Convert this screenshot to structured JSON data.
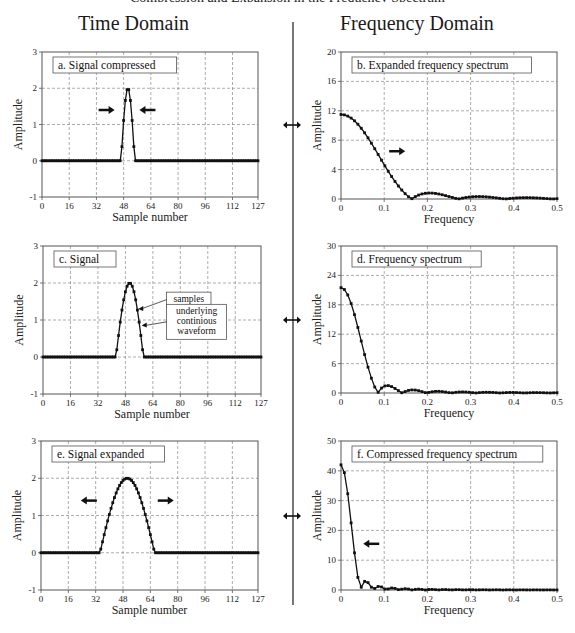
{
  "headings": {
    "time_domain": "Time Domain",
    "frequency_domain": "Frequency Domain",
    "clipped_top_title": "Compression and Expansion in the Frequency Spectrum"
  },
  "colors": {
    "line": "#111111",
    "grid": "#8a8a8a",
    "frame": "#555555",
    "divider": "#777777"
  },
  "chart_data": [
    {
      "id": "a",
      "type": "line",
      "title": "a.  Signal compressed",
      "xlabel": "Sample number",
      "ylabel": "Amplitude",
      "xlim": [
        0,
        127
      ],
      "ylim": [
        -1,
        3
      ],
      "xticks": [
        0,
        16,
        32,
        48,
        64,
        80,
        96,
        112,
        127
      ],
      "yticks": [
        -1,
        0,
        1,
        2,
        3
      ],
      "grid": true,
      "markers": true,
      "signal": {
        "kind": "hump",
        "center": 50.5,
        "half_width": 4,
        "peak": 2
      },
      "annotations": [
        {
          "type": "arrow-right",
          "x": 38,
          "y": 1.4
        },
        {
          "type": "arrow-left",
          "x": 62,
          "y": 1.4
        }
      ]
    },
    {
      "id": "b",
      "type": "line",
      "title": "b.  Expanded frequency spectrum",
      "xlabel": "Frequency",
      "ylabel": "Amplitude",
      "xlim": [
        0,
        0.5
      ],
      "ylim": [
        0,
        20
      ],
      "xticks": [
        0,
        0.1,
        0.2,
        0.3,
        0.4,
        0.5
      ],
      "yticks": [
        0,
        4,
        8,
        12,
        16,
        20
      ],
      "grid": true,
      "markers": true,
      "spectrum": {
        "peak": 11.5,
        "first_null": 0.163,
        "points": 64
      },
      "annotations": [
        {
          "type": "arrow-right",
          "x": 0.13,
          "y": 6.5
        }
      ]
    },
    {
      "id": "c",
      "type": "line",
      "title": "c.  Signal",
      "xlabel": "Sample number",
      "ylabel": "Amplitude",
      "xlim": [
        0,
        127
      ],
      "ylim": [
        -1,
        3
      ],
      "xticks": [
        0,
        16,
        32,
        48,
        64,
        80,
        96,
        112,
        127
      ],
      "yticks": [
        -1,
        0,
        1,
        2,
        3
      ],
      "grid": true,
      "markers": true,
      "signal": {
        "kind": "hump",
        "center": 50.5,
        "half_width": 8,
        "peak": 2
      },
      "callouts": [
        {
          "text": [
            "samples"
          ],
          "box_x": 72,
          "box_y": 1.55
        },
        {
          "text": [
            "underlying",
            "continious",
            "waveform"
          ],
          "box_x": 72,
          "box_y": 0.95
        }
      ]
    },
    {
      "id": "d",
      "type": "line",
      "title": "d.  Frequency spectrum",
      "xlabel": "Frequency",
      "ylabel": "Amplitude",
      "xlim": [
        0,
        0.5
      ],
      "ylim": [
        0,
        30
      ],
      "xticks": [
        0,
        0.1,
        0.2,
        0.3,
        0.4,
        0.5
      ],
      "yticks": [
        0,
        6,
        12,
        18,
        24,
        30
      ],
      "grid": true,
      "markers": true,
      "spectrum": {
        "peak": 21.5,
        "first_null": 0.085,
        "points": 64
      }
    },
    {
      "id": "e",
      "type": "line",
      "title": "e.  Signal expanded",
      "xlabel": "Sample number",
      "ylabel": "Amplitude",
      "xlim": [
        0,
        127
      ],
      "ylim": [
        -1,
        3
      ],
      "xticks": [
        0,
        16,
        32,
        48,
        64,
        80,
        96,
        112,
        127
      ],
      "yticks": [
        -1,
        0,
        1,
        2,
        3
      ],
      "grid": true,
      "markers": true,
      "signal": {
        "kind": "hump",
        "center": 50.5,
        "half_width": 16,
        "peak": 2
      },
      "annotations": [
        {
          "type": "arrow-left",
          "x": 28,
          "y": 1.4
        },
        {
          "type": "arrow-right",
          "x": 73,
          "y": 1.4
        }
      ]
    },
    {
      "id": "f",
      "type": "line",
      "title": "f.  Compressed frequency spectrum",
      "xlabel": "Frequency",
      "ylabel": "Amplitude",
      "xlim": [
        0,
        0.5
      ],
      "ylim": [
        0,
        50
      ],
      "xticks": [
        0,
        0.1,
        0.2,
        0.3,
        0.4,
        0.5
      ],
      "yticks": [
        0,
        10,
        20,
        30,
        40,
        50
      ],
      "grid": true,
      "markers": true,
      "spectrum": {
        "peak": 42,
        "first_null": 0.045,
        "points": 64
      },
      "annotations": [
        {
          "type": "arrow-left",
          "x": 0.07,
          "y": 15.5
        }
      ]
    }
  ],
  "layout": {
    "a": {
      "x0": 42,
      "y0": 52,
      "x1": 258,
      "y1": 197
    },
    "b": {
      "x0": 341,
      "y0": 52,
      "x1": 557,
      "y1": 199
    },
    "c": {
      "x0": 43,
      "y0": 246,
      "x1": 261,
      "y1": 394
    },
    "d": {
      "x0": 341,
      "y0": 246,
      "x1": 557,
      "y1": 393
    },
    "e": {
      "x0": 41,
      "y0": 441,
      "x1": 258,
      "y1": 590
    },
    "f": {
      "x0": 341,
      "y0": 441,
      "x1": 557,
      "y1": 590
    }
  },
  "transform_arrows": [
    {
      "x": 292,
      "y": 125
    },
    {
      "x": 292,
      "y": 320
    },
    {
      "x": 292,
      "y": 516
    }
  ]
}
